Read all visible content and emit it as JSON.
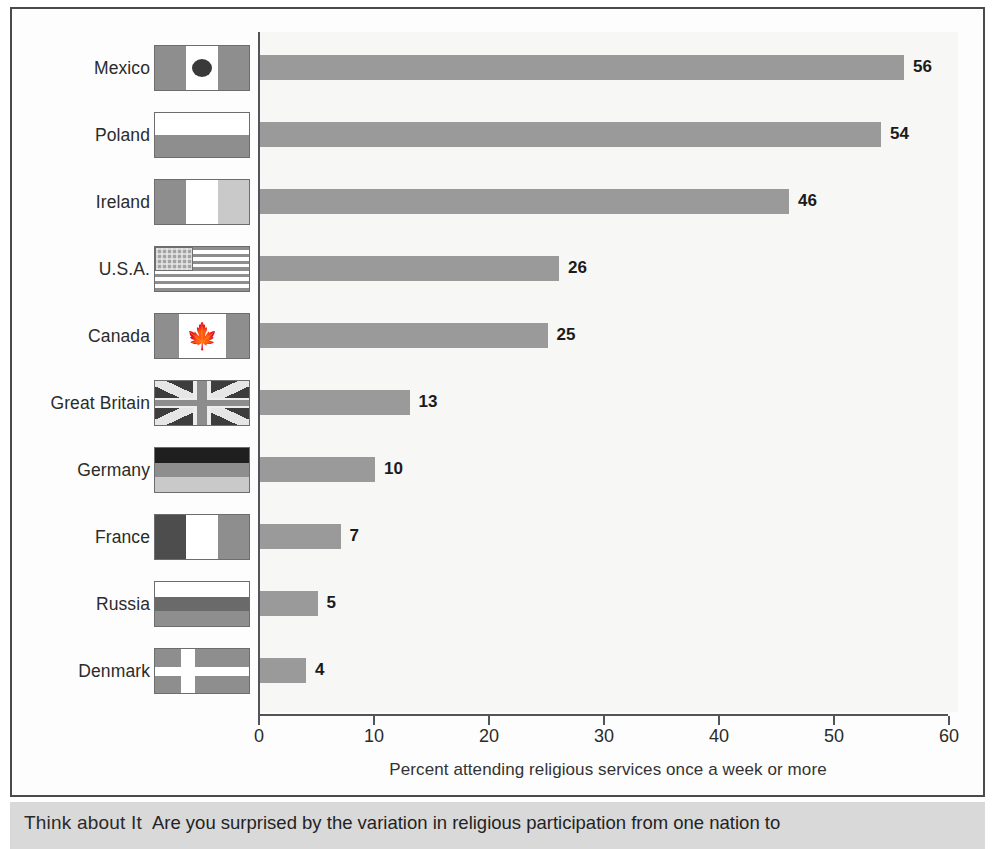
{
  "chart_data": {
    "type": "bar",
    "orientation": "horizontal",
    "title": "",
    "xlabel": "Percent attending religious services once a week or more",
    "ylabel": "",
    "xlim": [
      0,
      60
    ],
    "xticks": [
      0,
      10,
      20,
      30,
      40,
      50,
      60
    ],
    "grid": false,
    "legend": null,
    "bar_color": "#9a9a9a",
    "categories": [
      "Mexico",
      "Poland",
      "Ireland",
      "U.S.A.",
      "Canada",
      "Great Britain",
      "Germany",
      "France",
      "Russia",
      "Denmark"
    ],
    "values": [
      56,
      54,
      46,
      26,
      25,
      13,
      10,
      7,
      5,
      4
    ],
    "rows": [
      {
        "label": "Mexico",
        "value": 56,
        "value_text": "56",
        "flag": "mexico"
      },
      {
        "label": "Poland",
        "value": 54,
        "value_text": "54",
        "flag": "poland"
      },
      {
        "label": "Ireland",
        "value": 46,
        "value_text": "46",
        "flag": "ireland"
      },
      {
        "label": "U.S.A.",
        "value": 26,
        "value_text": "26",
        "flag": "usa"
      },
      {
        "label": "Canada",
        "value": 25,
        "value_text": "25",
        "flag": "canada"
      },
      {
        "label": "Great Britain",
        "value": 13,
        "value_text": "13",
        "flag": "great-britain"
      },
      {
        "label": "Germany",
        "value": 10,
        "value_text": "10",
        "flag": "germany"
      },
      {
        "label": "France",
        "value": 7,
        "value_text": "7",
        "flag": "france"
      },
      {
        "label": "Russia",
        "value": 5,
        "value_text": "5",
        "flag": "russia"
      },
      {
        "label": "Denmark",
        "value": 4,
        "value_text": "4",
        "flag": "denmark"
      }
    ]
  },
  "axis": {
    "tick_labels": [
      "0",
      "10",
      "20",
      "30",
      "40",
      "50",
      "60"
    ],
    "title": "Percent attending religious services once a week or more"
  },
  "caption": {
    "lead": "Think about It",
    "body": "Are you surprised by the variation in religious participation from one nation to"
  },
  "colors": {
    "bar": "#9a9a9a",
    "axis": "#53535a",
    "frame": "#4a4a4a",
    "plot_bg": "#f7f7f5",
    "caption_bg": "#d9d9d9",
    "text": "#2b2b2b"
  }
}
